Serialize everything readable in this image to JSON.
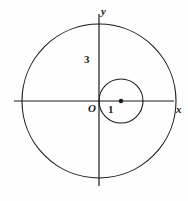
{
  "figure": {
    "background_color": "#fefefe",
    "stroke_color": "#1a1a1a",
    "axes": {
      "x_axis_label": "x",
      "y_axis_label": "y",
      "origin_label": "O",
      "x_axis_y_px": 101,
      "y_axis_x_px": 99,
      "x_axis_start_px": 14,
      "x_axis_end_px": 174,
      "y_axis_start_px": 14,
      "y_axis_end_px": 186
    },
    "tick_labels": [
      {
        "name": "y-tick-3",
        "text": "3",
        "value": 3,
        "axis": "y"
      },
      {
        "name": "x-tick-1",
        "text": "1",
        "value": 1,
        "axis": "x"
      }
    ]
  },
  "chart_data": {
    "type": "scatter",
    "xlabel": "x",
    "ylabel": "y",
    "xlim": [
      -3.4,
      3.4
    ],
    "ylim": [
      -3.4,
      3.4
    ],
    "grid": false,
    "legend": null,
    "units_per_pixel": 0.0389,
    "pixels_per_unit": 25.7,
    "annotations": [
      {
        "text": "O",
        "x": -0.2,
        "y": -0.25,
        "role": "origin-label"
      },
      {
        "text": "1",
        "x": 0.42,
        "y": -0.3,
        "role": "x-value-label"
      },
      {
        "text": "3",
        "x": -0.45,
        "y": 1.95,
        "role": "y-value-label"
      },
      {
        "text": "x",
        "x": 3.1,
        "y": -0.25,
        "role": "axis-name"
      },
      {
        "text": "y",
        "x": 0.14,
        "y": 3.3,
        "role": "axis-name"
      }
    ],
    "shapes": [
      {
        "name": "outer-circle",
        "type": "circle",
        "center": [
          0,
          0
        ],
        "radius": 3,
        "center_px": [
          99,
          101
        ],
        "radius_px": 77,
        "filled": false,
        "stroke": "#1a1a1a",
        "stroke_width": 1
      },
      {
        "name": "inner-circle",
        "type": "circle",
        "center": [
          1,
          0
        ],
        "radius": 1,
        "center_px": [
          121,
          101
        ],
        "radius_px": 22,
        "filled": false,
        "stroke": "#1a1a1a",
        "stroke_width": 1
      }
    ],
    "points": [
      {
        "name": "inner-circle-center-dot",
        "x": 1,
        "y": 0,
        "x_px": 121,
        "y_px": 101,
        "marker": "filled-circle",
        "radius_px": 2.2,
        "color": "#1a1a1a"
      }
    ]
  }
}
